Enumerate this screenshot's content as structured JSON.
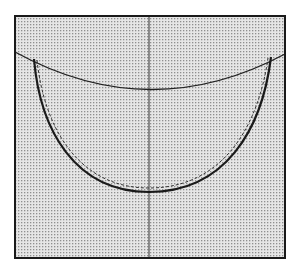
{
  "diagram": {
    "colors": {
      "background": "#ffffff",
      "fill_dots": "#9a9a9a",
      "fill_base": "#e4e4e4",
      "line": "#222222"
    },
    "frame": {
      "x": 15,
      "y": 16,
      "width": 270,
      "height": 242
    },
    "top_curve": {
      "start": [
        15,
        52
      ],
      "control": [
        150,
        126
      ],
      "end": [
        285,
        54
      ]
    },
    "u_curve": {
      "left_top": [
        35,
        60
      ],
      "bottom": [
        149,
        193
      ],
      "right_top": [
        271,
        58
      ]
    },
    "center_line": {
      "x": 149,
      "y1": 16,
      "y2": 258
    }
  }
}
